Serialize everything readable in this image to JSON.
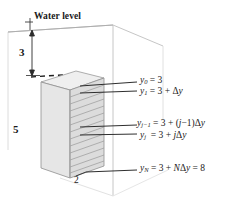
{
  "figure": {
    "water_level_label": "Water level",
    "dimensions": {
      "depth_above_column": "3",
      "column_height": "5",
      "column_base": "2"
    },
    "colors": {
      "column_left_face": "#e4e4e4",
      "column_right_face": "#dcdcdc",
      "column_top_face": "#efefef",
      "tank_line": "#c9c9c9",
      "leader_line": "#2b2b2b",
      "text": "#1a1a1a",
      "background": "#ffffff"
    },
    "node_labels": [
      {
        "id": "y0",
        "var": "y",
        "sub": "0",
        "text": "y0 = 3",
        "rhs": "= 3"
      },
      {
        "id": "y1",
        "var": "y",
        "sub": "1",
        "text": "y1 = 3 + Δy",
        "rhs": "= 3 + Δy"
      },
      {
        "id": "yjm1",
        "var": "y",
        "sub": "j−1",
        "text": "yj−1 = 3 + (j−1)Δy",
        "rhs": "= 3 + (j−1)Δy"
      },
      {
        "id": "yj",
        "var": "y",
        "sub": "j",
        "text": "yj = 3 + jΔy",
        "rhs": "= 3 + jΔy"
      },
      {
        "id": "yN",
        "var": "y",
        "sub": "N",
        "text": "yN = 3 + NΔy = 8",
        "rhs": "= 3 + NΔy = 8"
      }
    ]
  }
}
